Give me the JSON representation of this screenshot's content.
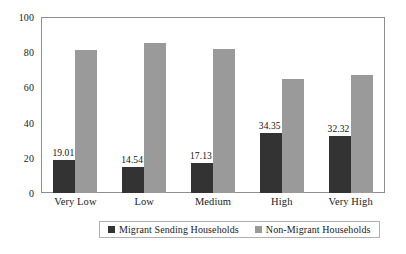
{
  "chart_data": {
    "type": "bar",
    "title": "",
    "subtitle": "",
    "xlabel": "",
    "ylabel": "",
    "ylim": [
      0,
      100
    ],
    "yticks": [
      0,
      20,
      40,
      60,
      80,
      100
    ],
    "grid": false,
    "legend_position": "bottom",
    "categories": [
      "Very Low",
      "Low",
      "Medium",
      "High",
      "Very High"
    ],
    "series": [
      {
        "name": "Migrant Sending Households",
        "color": "#333333",
        "values": [
          19.01,
          14.54,
          17.13,
          34.35,
          32.32
        ],
        "labels": [
          "19.01",
          "14.54",
          "17.13",
          "34.35",
          "32.32"
        ],
        "labels_shown": true
      },
      {
        "name": "Non-Migrant Households",
        "color": "#9a9a9a",
        "values": [
          81,
          85,
          82,
          65,
          67
        ],
        "labels": [
          "",
          "",
          "",
          "",
          ""
        ],
        "labels_shown": false
      }
    ]
  },
  "axis": {
    "y_tick_labels": [
      "0",
      "20",
      "40",
      "60",
      "80",
      "100"
    ]
  },
  "legend": {
    "items": [
      {
        "label": "Migrant Sending Households",
        "color": "#333333"
      },
      {
        "label": "Non-Migrant Households",
        "color": "#9a9a9a"
      }
    ]
  },
  "colors": {
    "series_dark": "#333333",
    "series_light": "#9a9a9a",
    "frame": "#8e8e8e",
    "text": "#1a1a1a",
    "background": "#ffffff"
  }
}
